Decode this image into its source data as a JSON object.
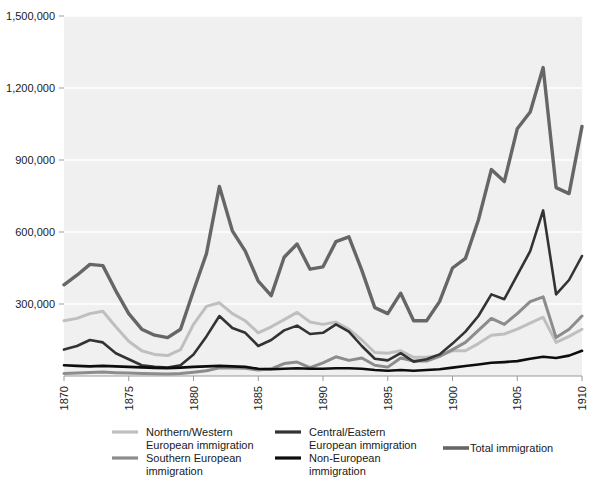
{
  "chart_data": {
    "type": "line",
    "title": "",
    "subtitle": "",
    "xlabel": "",
    "ylabel": "",
    "xlim": [
      1870,
      1910
    ],
    "ylim": [
      0,
      1500000
    ],
    "grid": true,
    "grid_axis": "y",
    "legend_position": "bottom",
    "x": [
      1870,
      1871,
      1872,
      1873,
      1874,
      1875,
      1876,
      1877,
      1878,
      1879,
      1880,
      1881,
      1882,
      1883,
      1884,
      1885,
      1886,
      1887,
      1888,
      1889,
      1890,
      1891,
      1892,
      1893,
      1894,
      1895,
      1896,
      1897,
      1898,
      1899,
      1900,
      1901,
      1902,
      1903,
      1904,
      1905,
      1906,
      1907,
      1908,
      1909,
      1910
    ],
    "x_tick_values": [
      1870,
      1875,
      1880,
      1885,
      1890,
      1895,
      1900,
      1905,
      1910
    ],
    "x_tick_labels": [
      "1870",
      "1875",
      "1880",
      "1885",
      "1890",
      "1895",
      "1900",
      "1905",
      "1910"
    ],
    "y_tick_values": [
      300000,
      600000,
      900000,
      1200000,
      1500000
    ],
    "y_tick_labels": [
      "300,000",
      "600,000",
      "900,000",
      "1,200,000",
      "1,500,000"
    ],
    "series": [
      {
        "name": "Northern/Western European immigration",
        "legend_label_line1": "Northern/Western",
        "legend_label_line2": "European immigration",
        "color": "#bfbfbf",
        "width": 3.0,
        "values": [
          230000,
          240000,
          260000,
          270000,
          205000,
          145000,
          105000,
          90000,
          85000,
          110000,
          215000,
          290000,
          305000,
          260000,
          230000,
          180000,
          205000,
          235000,
          265000,
          225000,
          215000,
          225000,
          195000,
          150000,
          98000,
          95000,
          105000,
          78000,
          78000,
          85000,
          105000,
          105000,
          135000,
          170000,
          175000,
          195000,
          220000,
          245000,
          140000,
          165000,
          195000
        ]
      },
      {
        "name": "Southern European immigration",
        "legend_label_line1": "Southern European",
        "legend_label_line2": "immigration",
        "color": "#8c8c8c",
        "width": 3.0,
        "values": [
          10000,
          12000,
          15000,
          17000,
          14000,
          12000,
          10000,
          9000,
          8000,
          10000,
          16000,
          22000,
          34000,
          33000,
          32000,
          25000,
          30000,
          52000,
          58000,
          35000,
          55000,
          80000,
          65000,
          75000,
          45000,
          37000,
          75000,
          62000,
          62000,
          82000,
          110000,
          140000,
          190000,
          240000,
          215000,
          260000,
          310000,
          330000,
          160000,
          195000,
          250000
        ]
      },
      {
        "name": "Central/Eastern European immigration",
        "legend_label_line1": "Central/Eastern",
        "legend_label_line2": "European immigration",
        "color": "#333333",
        "width": 2.6,
        "values": [
          110000,
          125000,
          150000,
          140000,
          95000,
          70000,
          45000,
          38000,
          35000,
          45000,
          90000,
          165000,
          250000,
          200000,
          180000,
          125000,
          150000,
          190000,
          210000,
          175000,
          180000,
          215000,
          185000,
          125000,
          72000,
          65000,
          95000,
          60000,
          70000,
          90000,
          135000,
          185000,
          250000,
          340000,
          320000,
          420000,
          520000,
          690000,
          340000,
          400000,
          500000
        ]
      },
      {
        "name": "Non-European immigration",
        "legend_label_line1": "Non-European",
        "legend_label_line2": "immigration",
        "color": "#0d0d0d",
        "width": 2.6,
        "values": [
          45000,
          42000,
          40000,
          42000,
          40000,
          38000,
          36000,
          34000,
          33000,
          35000,
          38000,
          40000,
          42000,
          40000,
          38000,
          30000,
          28000,
          30000,
          32000,
          30000,
          30000,
          32000,
          32000,
          30000,
          25000,
          22000,
          25000,
          22000,
          25000,
          28000,
          35000,
          42000,
          48000,
          55000,
          58000,
          62000,
          72000,
          80000,
          75000,
          85000,
          105000
        ]
      },
      {
        "name": "Total immigration",
        "legend_label_line1": "Total immigration",
        "legend_label_line2": "",
        "color": "#666666",
        "width": 3.4,
        "values": [
          380000,
          420000,
          465000,
          460000,
          355000,
          260000,
          195000,
          170000,
          160000,
          195000,
          355000,
          510000,
          790000,
          605000,
          520000,
          395000,
          335000,
          495000,
          550000,
          445000,
          455000,
          560000,
          580000,
          440000,
          285000,
          260000,
          345000,
          230000,
          230000,
          310000,
          450000,
          490000,
          650000,
          860000,
          810000,
          1030000,
          1100000,
          1285000,
          785000,
          760000,
          1040000
        ]
      }
    ]
  },
  "legend": {
    "entries": [
      {
        "label_line1": "Northern/Western",
        "label_line2": "European immigration",
        "color": "#bfbfbf"
      },
      {
        "label_line1": "Central/Eastern",
        "label_line2": "European immigration",
        "color": "#333333"
      },
      {
        "label_line1": "Southern European",
        "label_line2": "immigration",
        "color": "#8c8c8c"
      },
      {
        "label_line1": "Non-European",
        "label_line2": "immigration",
        "color": "#0d0d0d"
      },
      {
        "label_line1": "Total immigration",
        "label_line2": "",
        "color": "#666666"
      }
    ]
  },
  "style": {
    "plot_background": "#f0f0f0",
    "gridline_color": "#ffffff",
    "axis_color": "#999999",
    "text_color": "#1a1a1a",
    "page_background": "#ffffff"
  }
}
